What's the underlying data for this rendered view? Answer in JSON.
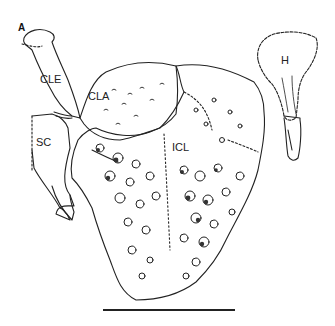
{
  "figure": {
    "panel_label": "A",
    "labels": {
      "cle": "CLE",
      "cla": "CLA",
      "sc": "SC",
      "icl": "ICL",
      "h": "H"
    },
    "scale_bar": {
      "visible": true,
      "length_label": ""
    },
    "colors": {
      "ink": "#222222",
      "background": "#ffffff"
    }
  }
}
